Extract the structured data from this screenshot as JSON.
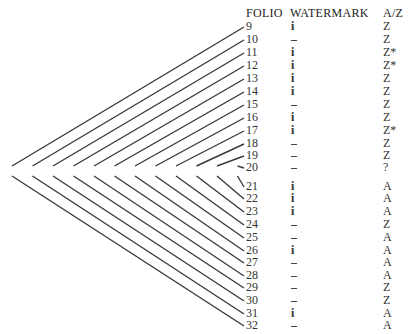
{
  "headers": {
    "folio": "FOLIO",
    "watermark": "WATERMARK",
    "az": "A/Z"
  },
  "rows": [
    {
      "folio": "9",
      "watermark": "i",
      "az": "Z",
      "y": 27
    },
    {
      "folio": "10",
      "watermark": "–",
      "az": "Z",
      "y": 40
    },
    {
      "folio": "11",
      "watermark": "i",
      "az": "Z*",
      "y": 53
    },
    {
      "folio": "12",
      "watermark": "i",
      "az": "Z*",
      "y": 66
    },
    {
      "folio": "13",
      "watermark": "i",
      "az": "Z",
      "y": 79
    },
    {
      "folio": "14",
      "watermark": "i",
      "az": "Z",
      "y": 92
    },
    {
      "folio": "15",
      "watermark": "–",
      "az": "Z",
      "y": 105
    },
    {
      "folio": "16",
      "watermark": "i",
      "az": "Z",
      "y": 118
    },
    {
      "folio": "17",
      "watermark": "i",
      "az": "Z*",
      "y": 131
    },
    {
      "folio": "18",
      "watermark": "–",
      "az": "Z",
      "y": 144
    },
    {
      "folio": "19",
      "watermark": "–",
      "az": "Z",
      "y": 156
    },
    {
      "folio": "20",
      "watermark": "–",
      "az": "?",
      "y": 168
    },
    {
      "folio": "21",
      "watermark": "i",
      "az": "A",
      "y": 187
    },
    {
      "folio": "22",
      "watermark": "i",
      "az": "A",
      "y": 199
    },
    {
      "folio": "23",
      "watermark": "i",
      "az": "A",
      "y": 212
    },
    {
      "folio": "24",
      "watermark": "–",
      "az": "Z",
      "y": 225
    },
    {
      "folio": "25",
      "watermark": "–",
      "az": "A",
      "y": 238
    },
    {
      "folio": "26",
      "watermark": "i",
      "az": "A",
      "y": 251
    },
    {
      "folio": "27",
      "watermark": "–",
      "az": "A",
      "y": 263
    },
    {
      "folio": "28",
      "watermark": "–",
      "az": "A",
      "y": 276
    },
    {
      "folio": "29",
      "watermark": "–",
      "az": "Z",
      "y": 288
    },
    {
      "folio": "30",
      "watermark": "–",
      "az": "Z",
      "y": 301
    },
    {
      "folio": "31",
      "watermark": "i",
      "az": "A",
      "y": 314
    },
    {
      "folio": "32",
      "watermark": "–",
      "az": "A",
      "y": 326
    }
  ],
  "collation": {
    "type": "quire diagram",
    "bifolia_count": 12,
    "line_color": "#3a3a3a"
  }
}
